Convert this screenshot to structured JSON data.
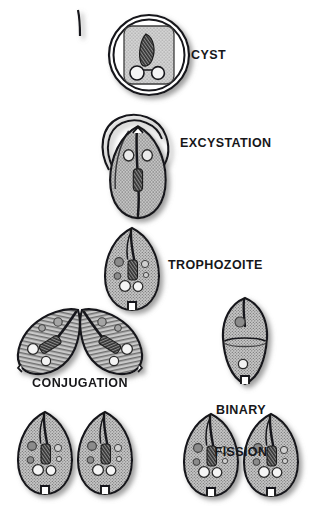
{
  "diagram": {
    "background_color": "#ffffff",
    "ink_color": "#17171a",
    "cell_fill_color": "#b9b9b9",
    "nucleus_color": "#3a3a3a",
    "vacuole_color": "#f2f2f2",
    "shadow_color": "#9a9a9a"
  },
  "labels": {
    "cyst": "CYST",
    "excystation": "EXCYSTATION",
    "trophozoite": "TROPHOZOITE",
    "conjugation": "CONJUGATION",
    "binary_fission_line1": "BINARY",
    "binary_fission_line2": "FISSION"
  },
  "stages": [
    {
      "id": "cyst",
      "label": "CYST",
      "label_x": 191,
      "label_y": 48,
      "cell_count": 1,
      "description": "Rounded cyst with double wall, stippled cytoplasm, curved macronucleus and two vacuoles"
    },
    {
      "id": "excystation",
      "label": "EXCYSTATION",
      "label_x": 180,
      "label_y": 136,
      "cell_count": 1,
      "description": "Trophozoite emerging from ruptured cyst wall"
    },
    {
      "id": "trophozoite",
      "label": "TROPHOZOITE",
      "label_x": 168,
      "label_y": 258,
      "cell_count": 1,
      "description": "Free-swimming ciliated trophozoite"
    },
    {
      "id": "conjugation",
      "label": "CONJUGATION",
      "label_x": 80,
      "label_y": 376,
      "cell_count": 2,
      "description": "Two cells joined at anterior ends exchanging nuclear material"
    },
    {
      "id": "binary-fission",
      "label": "BINARY FISSION",
      "label_x": 241,
      "label_y": 375,
      "cell_count": 1,
      "description": "Elongated cell constricting into two daughter cells"
    },
    {
      "id": "conjugation-daughters",
      "label": "",
      "cell_count": 2,
      "description": "Two separated daughter cells after conjugation"
    },
    {
      "id": "fission-daughters",
      "label": "",
      "cell_count": 2,
      "description": "Two separated daughter cells after binary fission"
    }
  ]
}
